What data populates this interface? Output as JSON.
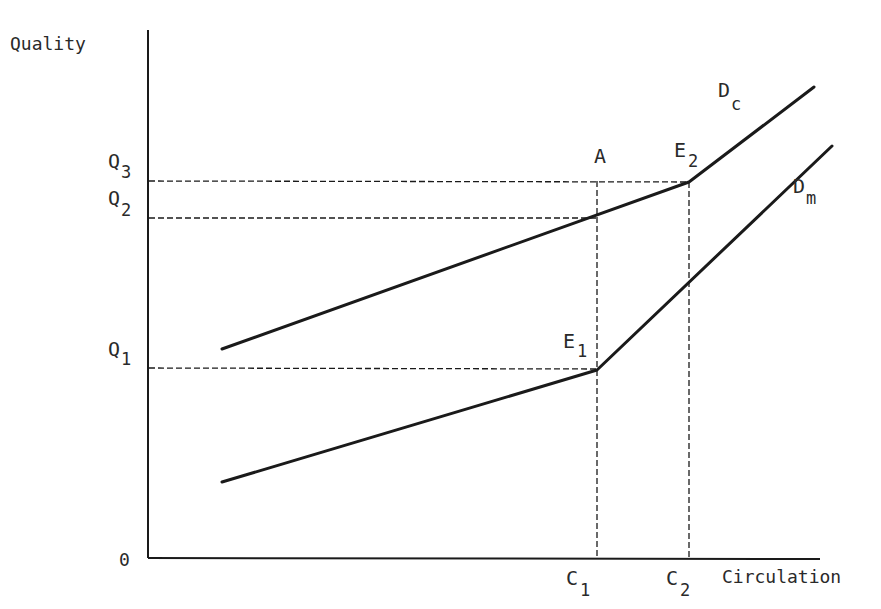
{
  "axes": {
    "y_label": "Quality",
    "x_label": "Circulation",
    "origin_label": "0"
  },
  "y_ticks": [
    {
      "main": "Q",
      "sub": "3",
      "name": "Q3"
    },
    {
      "main": "Q",
      "sub": "2",
      "name": "Q2"
    },
    {
      "main": "Q",
      "sub": "1",
      "name": "Q1"
    }
  ],
  "x_ticks": [
    {
      "main": "C",
      "sub": "1",
      "name": "C1"
    },
    {
      "main": "C",
      "sub": "2",
      "name": "C2"
    }
  ],
  "points": {
    "A": {
      "main": "A",
      "sub": ""
    },
    "E1": {
      "main": "E",
      "sub": "1"
    },
    "E2": {
      "main": "E",
      "sub": "2"
    }
  },
  "curves": {
    "Dc": {
      "main": "D",
      "sub": "c"
    },
    "Dm": {
      "main": "D",
      "sub": "m"
    }
  },
  "colors": {
    "line": "#1a1a1a",
    "text": "#2a2a2a",
    "background": "#ffffff"
  }
}
